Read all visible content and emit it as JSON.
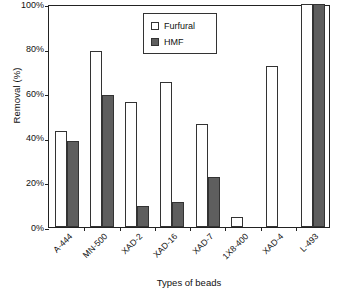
{
  "chart_data": {
    "type": "bar",
    "title": "",
    "xlabel": "Types of beads",
    "ylabel": "Removal (%)",
    "categories": [
      "A-444",
      "MN-500",
      "XAD-2",
      "XAD-16",
      "XAD-7",
      "1X8-400",
      "XAD-4",
      "L-493"
    ],
    "series": [
      {
        "name": "Furfural",
        "color": "#ffffff",
        "values": [
          43,
          79,
          56,
          65,
          46,
          4.5,
          72,
          100
        ]
      },
      {
        "name": "HMF",
        "color": "#5e5e5e",
        "values": [
          38.5,
          59,
          9.5,
          11,
          22.5,
          0,
          0,
          100
        ]
      }
    ],
    "ylim": [
      0,
      100
    ],
    "ytick_values": [
      0,
      20,
      40,
      60,
      80,
      100
    ],
    "ytick_labels": [
      "0%",
      "20%",
      "40%",
      "60%",
      "80%",
      "100%"
    ],
    "grid": false,
    "legend_position": "top-center"
  },
  "legend": {
    "entries": [
      {
        "label": "Furfural",
        "swatch": "hollow-square-icon"
      },
      {
        "label": "HMF",
        "swatch": "filled-square-icon"
      }
    ]
  }
}
